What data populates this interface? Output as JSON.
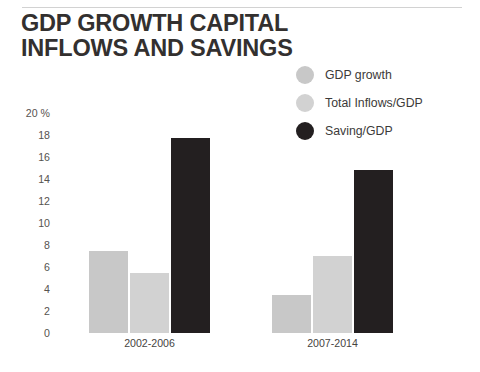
{
  "title": {
    "line1": "GDP GROWTH CAPITAL",
    "line2": "INFLOWS AND SAVINGS"
  },
  "colors": {
    "gdp_growth": "#c8c8c8",
    "total_inflows": "#d2d2d2",
    "saving": "#231f20",
    "text": "#33302f",
    "axis_text": "#56534f",
    "rule": "#d2d2d2",
    "background": "#ffffff"
  },
  "legend": {
    "items": [
      {
        "label": "GDP growth",
        "swatch": "legend-swatch-gdp-growth",
        "color": "#c8c8c8"
      },
      {
        "label": "Total Inflows/GDP",
        "swatch": "legend-swatch-total-inflows",
        "color": "#d2d2d2"
      },
      {
        "label": "Saving/GDP",
        "swatch": "legend-swatch-saving",
        "color": "#231f20"
      }
    ]
  },
  "chart_data": {
    "type": "bar",
    "title": "GDP GROWTH CAPITAL INFLOWS AND SAVINGS",
    "xlabel": "",
    "ylabel": "20 %",
    "ylim": [
      0,
      20
    ],
    "yticks": [
      "20 %",
      "18",
      "16",
      "14",
      "12",
      "10",
      "8",
      "6",
      "4",
      "2",
      "0"
    ],
    "ytick_values": [
      20,
      18,
      16,
      14,
      12,
      10,
      8,
      6,
      4,
      2,
      0
    ],
    "grid": false,
    "legend_position": "top-right",
    "categories": [
      "2002-2006",
      "2007-2014"
    ],
    "series": [
      {
        "name": "GDP growth",
        "color": "#c8c8c8",
        "values": [
          7.5,
          3.5
        ]
      },
      {
        "name": "Total Inflows/GDP",
        "color": "#d2d2d2",
        "values": [
          5.5,
          7.0
        ]
      },
      {
        "name": "Saving/GDP",
        "color": "#231f20",
        "values": [
          17.7,
          14.8
        ]
      }
    ]
  }
}
